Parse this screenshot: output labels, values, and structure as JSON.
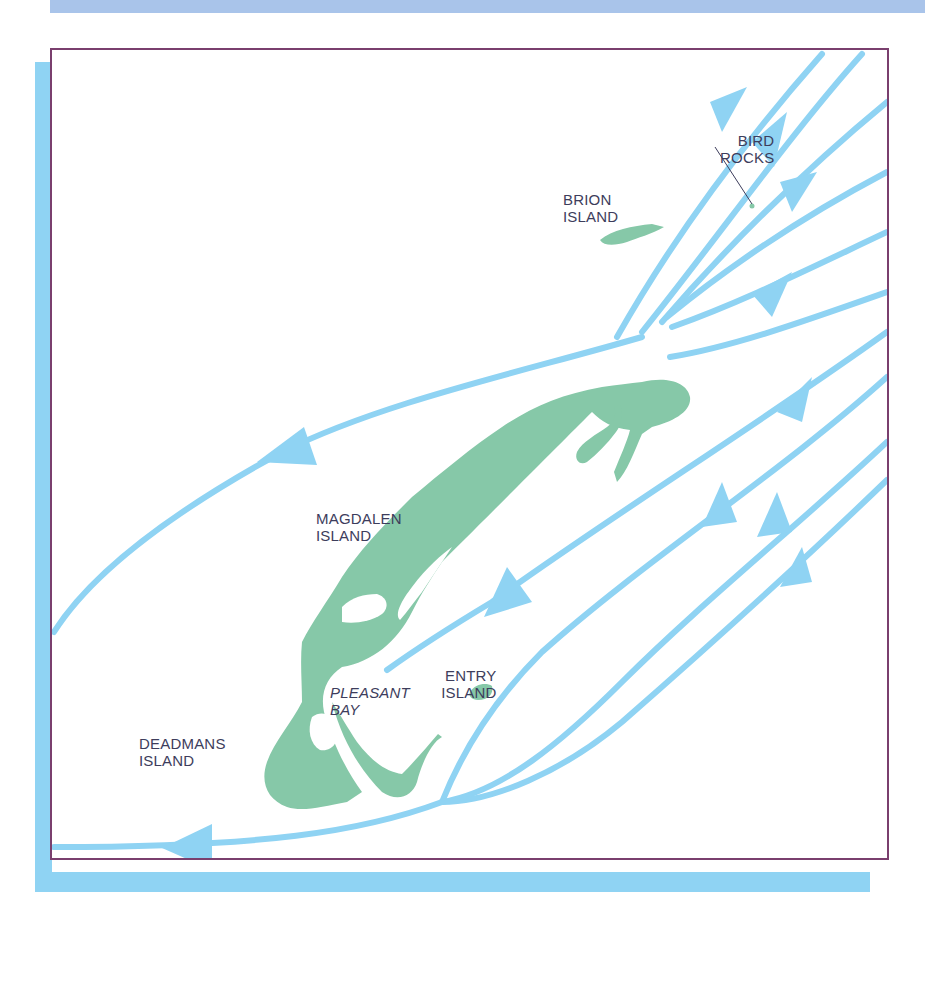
{
  "map": {
    "colors": {
      "current": "#8fd3f3",
      "land": "#86c8a8",
      "frame": "#7a3f6e",
      "shadow": "#8fd3f3",
      "top_band": "#a9c4ea",
      "label": "#3d3d5c"
    },
    "labels": {
      "bird_rocks": {
        "line1": "BIRD",
        "line2": "ROCKS"
      },
      "brion_island": {
        "line1": "BRION",
        "line2": "ISLAND"
      },
      "magdalen_island": {
        "line1": "MAGDALEN",
        "line2": "ISLAND"
      },
      "pleasant_bay": {
        "line1": "PLEASANT",
        "line2": "BAY"
      },
      "entry_island": {
        "line1": "ENTRY",
        "line2": "ISLAND"
      },
      "deadmans_island": {
        "line1": "DEADMANS",
        "line2": "ISLAND"
      }
    }
  }
}
